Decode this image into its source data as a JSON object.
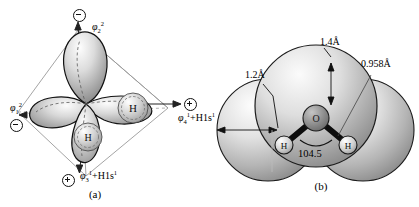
{
  "figure": {
    "panels": [
      {
        "id": "a",
        "caption": "(a)",
        "description": "tetrahedral sp3 hybrid orbital diagram of water",
        "atom_labels": [
          "H",
          "H"
        ],
        "orbital_labels": [
          {
            "name": "phi-2",
            "text": "φ",
            "sub": "2",
            "sup": "2",
            "sign": "minus",
            "position": "top"
          },
          {
            "name": "phi-1",
            "text": "φ",
            "sub": "1",
            "sup": "2",
            "sign": "minus",
            "position": "left"
          },
          {
            "name": "phi-4",
            "text": "φ",
            "sub": "4",
            "sup": "1",
            "suffix": "+H1s",
            "suffix_sup": "1",
            "sign": "plus",
            "position": "right"
          },
          {
            "name": "phi-3",
            "text": "φ",
            "sub": "3",
            "sup": "1",
            "suffix": "+H1s",
            "suffix_sup": "1",
            "sign": "plus",
            "position": "bottom"
          }
        ]
      },
      {
        "id": "b",
        "caption": "(b)",
        "description": "space filling model of the water molecule",
        "atoms": {
          "center": "O",
          "left": "H",
          "right": "H"
        },
        "dimensions": [
          {
            "name": "oxygen-radius",
            "value": "1.4Å"
          },
          {
            "name": "bond-length",
            "value": "0.958Å"
          },
          {
            "name": "hydrogen-radius",
            "value": "1.2Å"
          }
        ],
        "bond_angle": "104.5"
      }
    ]
  },
  "colors": {
    "outline": "#111111",
    "lobe_light": "#f4f4f4",
    "lobe_mid": "#bfbfbf",
    "lobe_dark": "#8a8a8a",
    "sphere_light": "#ffffff",
    "sphere_mid": "#c9c9c9",
    "sphere_dark": "#7d7d7d",
    "wire": "#9a9a9a",
    "dashed": "#6a6a6a"
  }
}
